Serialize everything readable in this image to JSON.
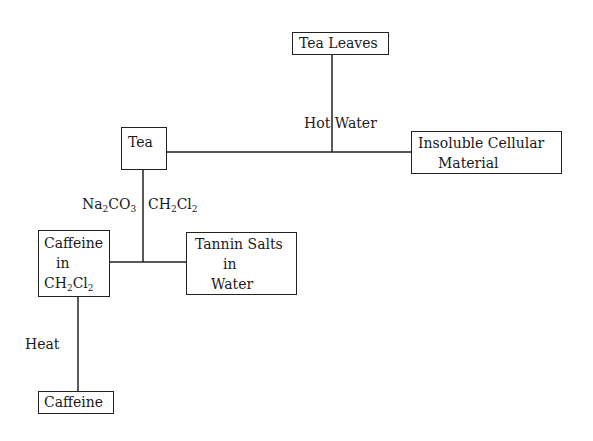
{
  "diagram": {
    "type": "flowchart",
    "nodes": {
      "tea_leaves": {
        "lines": [
          "Tea Leaves"
        ]
      },
      "tea": {
        "lines": [
          "Tea"
        ]
      },
      "insoluble": {
        "lines": [
          "Insoluble Cellular",
          "Material"
        ]
      },
      "caffeine_in_ch2cl2": {
        "lines": [
          "Caffeine",
          "in"
        ],
        "formula": {
          "main1": "CH",
          "sub1": "2",
          "main2": "Cl",
          "sub2": "2"
        }
      },
      "tannin": {
        "lines": [
          "Tannin Salts",
          "in",
          "Water"
        ]
      },
      "caffeine": {
        "lines": [
          "Caffeine"
        ]
      }
    },
    "edge_labels": {
      "hot_water": "Hot Water",
      "na2co3": {
        "main1": "Na",
        "sub1": "2",
        "main2": "CO",
        "sub2": "3"
      },
      "ch2cl2": {
        "main1": "CH",
        "sub1": "2",
        "main2": "Cl",
        "sub2": "2"
      },
      "heat": "Heat"
    },
    "edges": [
      {
        "from": "Tea Leaves",
        "to": "Tea / Insoluble Cellular Material",
        "label": "Hot Water"
      },
      {
        "from": "Tea",
        "to": "Caffeine in CH2Cl2 / Tannin Salts in Water",
        "label": "Na2CO3 CH2Cl2"
      },
      {
        "from": "Caffeine in CH2Cl2",
        "to": "Caffeine",
        "label": "Heat"
      }
    ]
  }
}
